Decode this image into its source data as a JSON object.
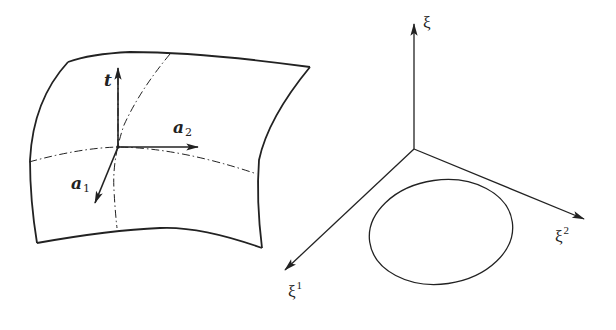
{
  "figure": {
    "colors": {
      "stroke": "#222222",
      "background": "#ffffff"
    },
    "left_panel": {
      "description": "curved shell surface with local base vectors",
      "labels": {
        "t": "t",
        "a1_base": "a",
        "a1_sub": "1",
        "a2_base": "a",
        "a2_sub": "2"
      }
    },
    "right_panel": {
      "description": "parameter space axes with closed boundary curve",
      "labels": {
        "xi": "ξ",
        "xi1_base": "ξ",
        "xi1_sup": "1",
        "xi2_base": "ξ",
        "xi2_sup": "2"
      }
    }
  }
}
